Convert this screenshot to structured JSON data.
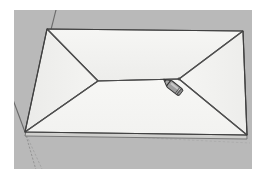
{
  "window": {
    "title": "3D Model Viewport",
    "background_color": "#ffffff"
  },
  "viewport": {
    "name": "modeling-viewport",
    "background_color": "#b9b9b9",
    "width": 238,
    "height": 159,
    "origin_x": 14,
    "origin_y": 10
  },
  "model": {
    "name": "hip-roof",
    "description": "Hip roof rectangular plan with four sloped faces meeting at a central ridge",
    "face_fill": "#f3f3f1",
    "face_fill_left": "#efefed",
    "face_fill_right": "#f1f1ef",
    "face_fill_front": "#f6f6f4",
    "face_fill_back": "#f2f2f0",
    "edge_color": "#555555",
    "edge_width": 1.1,
    "eaves_color": "#6b6b6b",
    "vertices": {
      "plan_top_left": [
        33,
        19
      ],
      "plan_top_right": [
        229,
        21
      ],
      "plan_bottom_right": [
        233,
        125
      ],
      "plan_bottom_left": [
        11,
        122
      ],
      "ridge_left": [
        84,
        71
      ],
      "ridge_right": [
        165,
        69
      ]
    },
    "fascia_offset": 4
  },
  "axes": {
    "name": "model-axes",
    "origin": [
      11,
      122
    ],
    "green_axis_color": "#3f7a3f",
    "red_axis_color": "#9a4040",
    "blue_axis_color": "#3f4f8a",
    "lines": [
      {
        "name": "axis-green-up-left",
        "to": [
          44,
          -8
        ],
        "color": "#6a6a6a",
        "dashed": false
      },
      {
        "name": "axis-red-left",
        "to": [
          -12,
          60
        ],
        "color": "#6a6a6a",
        "dashed": false
      },
      {
        "name": "axis-blue-down",
        "to": [
          22,
          160
        ],
        "color": "#8a8a8a",
        "dashed": true
      },
      {
        "name": "axis-green-down-right",
        "to": [
          28,
          159
        ],
        "color": "#9a9a9a",
        "dashed": true
      }
    ]
  },
  "cursor": {
    "name": "line-tool-cursor",
    "icon": "pencil-icon",
    "label": "Pencil / Line tool",
    "x": 157,
    "y": 70,
    "rotation": 38,
    "body_color": "#9a9a9a",
    "outline_color": "#3a3a3a",
    "tip_color": "#707070"
  },
  "inference": {
    "name": "inference-point",
    "visible": true,
    "x": 165,
    "y": 69,
    "color": "#4a4a4a"
  }
}
